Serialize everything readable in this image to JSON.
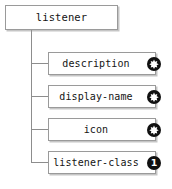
{
  "diagram": {
    "type": "xml-schema-element-tree",
    "root": {
      "label": "listener",
      "badge": null
    },
    "children": [
      {
        "label": "description",
        "badge": "star",
        "badge_text": "*"
      },
      {
        "label": "display-name",
        "badge": "star",
        "badge_text": "*"
      },
      {
        "label": "icon",
        "badge": "star",
        "badge_text": "*"
      },
      {
        "label": "listener-class",
        "badge": "one",
        "badge_text": "1"
      }
    ],
    "colors": {
      "background": "#ffffff",
      "box_border": "#9a9a9a",
      "box_fill": "#ffffff",
      "connector": "#8d8d8d",
      "text": "#141414",
      "badge_fill": "#101010",
      "badge_glyph": "#ffffff"
    }
  }
}
